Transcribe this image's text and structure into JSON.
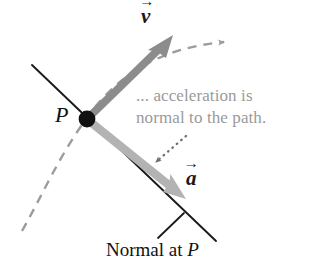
{
  "figure": {
    "kind": "vector-diagram",
    "background_color": "#ffffff",
    "width": 311,
    "height": 268,
    "point_label": "P",
    "velocity_vector": {
      "symbol": "v",
      "arrow_accent": "→",
      "color": "#8c8c8c",
      "description": "velocity vector tangent to the path at P"
    },
    "acceleration_vector": {
      "symbol": "a",
      "arrow_accent": "→",
      "color": "#b3b3b3",
      "description": "acceleration vector along the normal at P"
    },
    "path_curve": {
      "style": "dashed",
      "color": "#9c9c9c",
      "description": "dashed curved path through P with arrowhead"
    },
    "normal_line": {
      "style": "solid",
      "color": "#1a1a1a",
      "description": "thin straight normal line through P"
    },
    "pointer": {
      "style": "dotted",
      "color": "#6e6e6e",
      "description": "dotted arrow from the callout to the acceleration vector"
    },
    "leader_line": {
      "style": "solid",
      "color": "#1a1a1a",
      "description": "leader tick from the caption up to the normal line"
    }
  },
  "annotation": {
    "color": "#9a9a9a",
    "line1": "... acceleration is",
    "line2": "normal to the path."
  },
  "caption": {
    "color": "#111111",
    "text_before": "Normal at ",
    "point": "P"
  }
}
